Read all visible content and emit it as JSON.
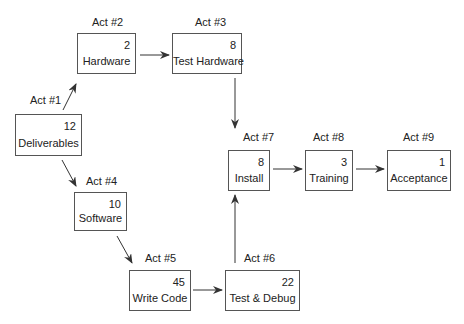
{
  "diagram": {
    "type": "activity-network",
    "nodes": [
      {
        "id": "act1",
        "act_label": "Act #1",
        "duration": "12",
        "name": "Deliverables"
      },
      {
        "id": "act2",
        "act_label": "Act #2",
        "duration": "2",
        "name": "Hardware"
      },
      {
        "id": "act3",
        "act_label": "Act #3",
        "duration": "8",
        "name": "Test Hardware"
      },
      {
        "id": "act4",
        "act_label": "Act #4",
        "duration": "10",
        "name": "Software"
      },
      {
        "id": "act5",
        "act_label": "Act #5",
        "duration": "45",
        "name": "Write Code"
      },
      {
        "id": "act6",
        "act_label": "Act #6",
        "duration": "22",
        "name": "Test & Debug"
      },
      {
        "id": "act7",
        "act_label": "Act #7",
        "duration": "8",
        "name": "Install"
      },
      {
        "id": "act8",
        "act_label": "Act #8",
        "duration": "3",
        "name": "Training"
      },
      {
        "id": "act9",
        "act_label": "Act #9",
        "duration": "1",
        "name": "Acceptance"
      }
    ],
    "edges": [
      {
        "from": "act1",
        "to": "act2"
      },
      {
        "from": "act2",
        "to": "act3"
      },
      {
        "from": "act3",
        "to": "act7"
      },
      {
        "from": "act1",
        "to": "act4"
      },
      {
        "from": "act4",
        "to": "act5"
      },
      {
        "from": "act5",
        "to": "act6"
      },
      {
        "from": "act6",
        "to": "act7"
      },
      {
        "from": "act7",
        "to": "act8"
      },
      {
        "from": "act8",
        "to": "act9"
      }
    ],
    "colors": {
      "line": "#333333",
      "border": "#555555",
      "text": "#222222"
    }
  }
}
